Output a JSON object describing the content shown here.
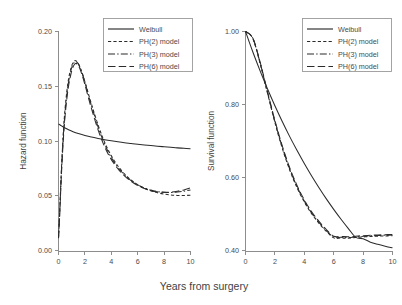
{
  "figure": {
    "background_color": "#ffffff",
    "line_color": "#2b2b2b",
    "axis_color": "#8d8d8d",
    "shared_xlabel": "Years from surgery"
  },
  "legend": {
    "entries": [
      {
        "label": "Weibull",
        "dash": "solid",
        "key": "weibull"
      },
      {
        "label": "PH(2) model",
        "dash": "dashed",
        "key": "ph2"
      },
      {
        "label": "PH(3) model",
        "dash": "dashdot",
        "key": "ph3"
      },
      {
        "label": "PH(6) model",
        "dash": "longdash",
        "key": "ph6"
      }
    ]
  },
  "chart_data": [
    {
      "id": "hazard-panel",
      "type": "line",
      "title": "",
      "xlabel": "Years from surgery",
      "ylabel": "Hazard function",
      "xlim": [
        0,
        10
      ],
      "ylim": [
        0.0,
        0.2
      ],
      "xticks": [
        0,
        2,
        4,
        6,
        8,
        10
      ],
      "xticklabels": [
        "0",
        "2",
        "4",
        "6",
        "8",
        "10"
      ],
      "yticks": [
        0.0,
        0.05,
        0.1,
        0.15,
        0.2
      ],
      "yticklabels": [
        "0.00",
        "0.05",
        "0.10",
        "0.15",
        "0.20"
      ],
      "grid": false,
      "legend_position": "upper right",
      "series": [
        {
          "name": "Weibull",
          "dash": "solid",
          "x": [
            0.0,
            0.15,
            0.3,
            0.5,
            0.8,
            1.1,
            1.5,
            2.0,
            2.5,
            3.0,
            3.5,
            4.0,
            4.5,
            5.0,
            5.5,
            6.0,
            6.5,
            7.0,
            7.5,
            8.0,
            8.5,
            9.0,
            9.5,
            10.0
          ],
          "y": [
            0.116,
            0.1148,
            0.1136,
            0.1122,
            0.1104,
            0.1089,
            0.1072,
            0.1054,
            0.104,
            0.1027,
            0.1016,
            0.1006,
            0.0997,
            0.0989,
            0.0982,
            0.0975,
            0.0969,
            0.0963,
            0.0957,
            0.0952,
            0.0947,
            0.0942,
            0.0938,
            0.0934
          ]
        },
        {
          "name": "PH(2) model",
          "dash": "dashed",
          "x": [
            0.0,
            0.1,
            0.25,
            0.45,
            0.7,
            0.95,
            1.15,
            1.3,
            1.45,
            1.6,
            1.8,
            2.0,
            2.3,
            2.6,
            3.0,
            3.4,
            3.8,
            4.2,
            4.6,
            5.0,
            5.5,
            6.0,
            6.5,
            7.0,
            7.5,
            8.0,
            8.5,
            9.0,
            9.5,
            10.0
          ],
          "y": [
            0.0125,
            0.039,
            0.082,
            0.123,
            0.152,
            0.167,
            0.1725,
            0.1735,
            0.172,
            0.1685,
            0.162,
            0.1545,
            0.142,
            0.13,
            0.115,
            0.102,
            0.0915,
            0.083,
            0.0762,
            0.0706,
            0.065,
            0.0608,
            0.0576,
            0.0552,
            0.0534,
            0.0522,
            0.0514,
            0.051,
            0.0509,
            0.0512
          ]
        },
        {
          "name": "PH(3) model",
          "dash": "dashdot",
          "x": [
            0.0,
            0.1,
            0.25,
            0.45,
            0.7,
            0.95,
            1.15,
            1.3,
            1.45,
            1.6,
            1.8,
            2.0,
            2.3,
            2.6,
            3.0,
            3.4,
            3.8,
            4.2,
            4.6,
            5.0,
            5.5,
            6.0,
            6.5,
            7.0,
            7.5,
            8.0,
            8.5,
            9.0,
            9.5,
            10.0
          ],
          "y": [
            0.0122,
            0.038,
            0.08,
            0.12,
            0.149,
            0.165,
            0.1712,
            0.1726,
            0.1715,
            0.1682,
            0.1618,
            0.154,
            0.1408,
            0.1285,
            0.1132,
            0.1002,
            0.0898,
            0.0815,
            0.075,
            0.0697,
            0.0645,
            0.0606,
            0.0578,
            0.0558,
            0.0545,
            0.0538,
            0.0536,
            0.054,
            0.0548,
            0.056
          ]
        },
        {
          "name": "PH(6) model",
          "dash": "longdash",
          "x": [
            0.0,
            0.1,
            0.25,
            0.45,
            0.7,
            0.95,
            1.15,
            1.3,
            1.45,
            1.6,
            1.8,
            2.0,
            2.3,
            2.6,
            3.0,
            3.4,
            3.8,
            4.2,
            4.6,
            5.0,
            5.5,
            6.0,
            6.5,
            7.0,
            7.5,
            8.0,
            8.5,
            9.0,
            9.5,
            10.0
          ],
          "y": [
            0.012,
            0.036,
            0.077,
            0.1165,
            0.1455,
            0.1618,
            0.169,
            0.171,
            0.17,
            0.1668,
            0.16,
            0.1518,
            0.1382,
            0.1258,
            0.1105,
            0.0978,
            0.0878,
            0.08,
            0.0738,
            0.0688,
            0.0638,
            0.06,
            0.0572,
            0.0553,
            0.0542,
            0.0538,
            0.054,
            0.0548,
            0.056,
            0.0578
          ]
        }
      ]
    },
    {
      "id": "survival-panel",
      "type": "line",
      "title": "",
      "xlabel": "Years from surgery",
      "ylabel": "Survival function",
      "xlim": [
        0,
        10
      ],
      "ylim": [
        0.4,
        1.0
      ],
      "xticks": [
        0,
        2,
        4,
        6,
        8,
        10
      ],
      "xticklabels": [
        "0",
        "2",
        "4",
        "6",
        "8",
        "10"
      ],
      "yticks": [
        0.4,
        0.6,
        0.8,
        1.0
      ],
      "yticklabels": [
        "0.40",
        "0.60",
        "0.80",
        "1.00"
      ],
      "grid": false,
      "legend_position": "upper right",
      "series": [
        {
          "name": "Weibull",
          "dash": "solid",
          "x": [
            0.0,
            0.5,
            1.0,
            1.5,
            2.0,
            2.5,
            3.0,
            3.5,
            4.0,
            4.5,
            5.0,
            5.5,
            6.0,
            6.5,
            7.0,
            7.5,
            8.0,
            8.5,
            9.0,
            9.5,
            10.0
          ],
          "y": [
            1.0,
            0.944,
            0.892,
            0.843,
            0.7975,
            0.7545,
            0.714,
            0.676,
            0.64,
            0.606,
            0.574,
            0.5435,
            0.515,
            0.488,
            0.4625,
            0.4385,
            0.435,
            0.4255,
            0.4195,
            0.4145,
            0.41
          ]
        },
        {
          "name": "PH(2) model",
          "dash": "dashed",
          "x": [
            0.0,
            0.5,
            1.0,
            1.5,
            2.0,
            2.5,
            3.0,
            3.5,
            4.0,
            4.5,
            5.0,
            5.5,
            6.0,
            6.5,
            7.0,
            7.5,
            8.0,
            8.5,
            9.0,
            9.5,
            10.0
          ],
          "y": [
            1.0,
            0.9805,
            0.912,
            0.831,
            0.752,
            0.682,
            0.623,
            0.5745,
            0.535,
            0.503,
            0.4768,
            0.4552,
            0.4372,
            0.4368,
            0.4362,
            0.438,
            0.4396,
            0.441,
            0.4418,
            0.4424,
            0.443
          ]
        },
        {
          "name": "PH(3) model",
          "dash": "dashdot",
          "x": [
            0.0,
            0.5,
            1.0,
            1.5,
            2.0,
            2.5,
            3.0,
            3.5,
            4.0,
            4.5,
            5.0,
            5.5,
            6.0,
            6.5,
            7.0,
            7.5,
            8.0,
            8.5,
            9.0,
            9.5,
            10.0
          ],
          "y": [
            1.0,
            0.9812,
            0.9135,
            0.833,
            0.7545,
            0.6848,
            0.6258,
            0.5772,
            0.5375,
            0.5052,
            0.479,
            0.4572,
            0.4392,
            0.4386,
            0.438,
            0.4398,
            0.4414,
            0.4428,
            0.4436,
            0.4442,
            0.4448
          ]
        },
        {
          "name": "PH(6) model",
          "dash": "longdash",
          "x": [
            0.0,
            0.5,
            1.0,
            1.5,
            2.0,
            2.5,
            3.0,
            3.5,
            4.0,
            4.5,
            5.0,
            5.5,
            6.0,
            6.5,
            7.0,
            7.5,
            8.0,
            8.5,
            9.0,
            9.5,
            10.0
          ],
          "y": [
            1.0,
            0.982,
            0.9155,
            0.8355,
            0.7575,
            0.688,
            0.6292,
            0.5806,
            0.5408,
            0.5084,
            0.482,
            0.46,
            0.4418,
            0.441,
            0.4402,
            0.4418,
            0.4432,
            0.4444,
            0.4452,
            0.4458,
            0.4464
          ]
        }
      ]
    }
  ]
}
